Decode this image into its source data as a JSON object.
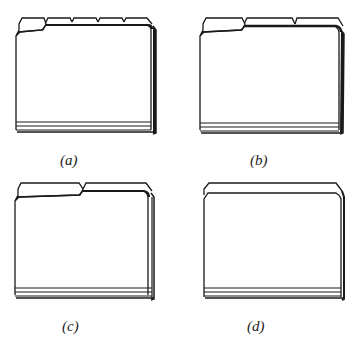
{
  "figure": {
    "folders": [
      {
        "id": "a",
        "label": "(a)",
        "tab_style": "fifth-cut",
        "tab_count": 5
      },
      {
        "id": "b",
        "label": "(b)",
        "tab_style": "third-cut",
        "tab_count": 3
      },
      {
        "id": "c",
        "label": "(c)",
        "tab_style": "half-cut",
        "tab_count": 2
      },
      {
        "id": "d",
        "label": "(d)",
        "tab_style": "straight-cut",
        "tab_count": 1
      }
    ]
  },
  "colors": {
    "line": "#1a1a1a",
    "background": "#ffffff"
  }
}
